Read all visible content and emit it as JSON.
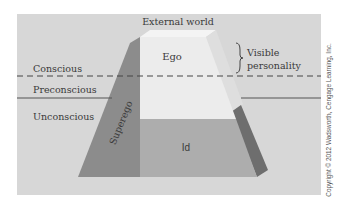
{
  "figure": {
    "labels": {
      "external_world": "External world",
      "ego": "Ego",
      "id": "Id",
      "superego": "Superego",
      "visible_personality_line1": "Visible",
      "visible_personality_line2": "personality",
      "conscious": "Conscious",
      "preconscious": "Preconscious",
      "unconscious": "Unconscious"
    },
    "credit": "Copyright © 2012 Wadsworth, Cengage Learning, Inc.",
    "colors": {
      "background": "#ffffff",
      "panel": "#d7d7d7",
      "ego_face": "#ececec",
      "top_cap": "#f3f3f3",
      "id_face": "#b0b0b0",
      "superego": "#8e8e8e",
      "side_light": "#dcdcdc",
      "side_dark": "#6f6f6f",
      "lines": "#555555"
    }
  }
}
